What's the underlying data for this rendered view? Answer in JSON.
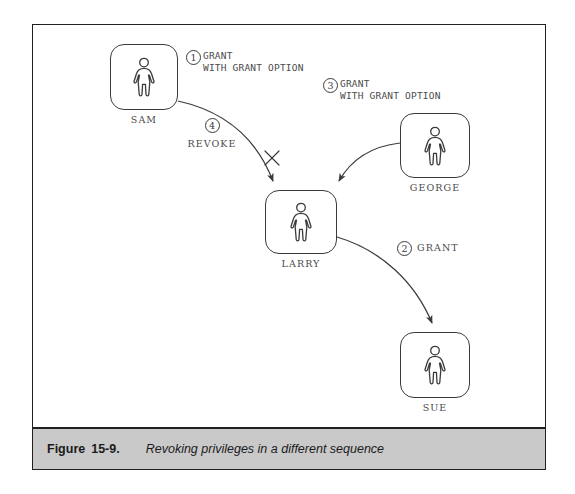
{
  "figure": {
    "caption_label": "Figure",
    "caption_number": "15-9.",
    "caption_title": "Revoking privileges in a different sequence"
  },
  "diagram": {
    "type": "flow-diagram",
    "nodes": [
      {
        "id": "sam",
        "label": "SAM",
        "icon": "person-icon",
        "x": 110,
        "y": 44,
        "w": 68,
        "h": 66
      },
      {
        "id": "george",
        "label": "GEORGE",
        "icon": "person-icon",
        "x": 400,
        "y": 113,
        "w": 70,
        "h": 65
      },
      {
        "id": "larry",
        "label": "LARRY",
        "icon": "person-icon",
        "x": 265,
        "y": 190,
        "w": 72,
        "h": 64
      },
      {
        "id": "sue",
        "label": "SUE",
        "icon": "person-icon",
        "x": 400,
        "y": 332,
        "w": 70,
        "h": 66
      }
    ],
    "edges": [
      {
        "id": "edge-1",
        "step": "1",
        "from": "sam",
        "to": "larry",
        "text_line1": "GRANT",
        "text_line2": "WITH GRANT OPTION",
        "revoked": true
      },
      {
        "id": "edge-2",
        "step": "2",
        "from": "larry",
        "to": "sue",
        "text_line1": "GRANT",
        "text_line2": "",
        "revoked": false
      },
      {
        "id": "edge-3",
        "step": "3",
        "from": "george",
        "to": "larry",
        "text_line1": "GRANT",
        "text_line2": "WITH GRANT OPTION",
        "revoked": false
      },
      {
        "id": "edge-4",
        "step": "4",
        "from": "sam",
        "to": "larry",
        "text_line1": "REVOKE",
        "text_line2": "",
        "revoked": false
      }
    ],
    "marks": [
      {
        "id": "revoke-cross",
        "type": "x-cross",
        "x": 272,
        "y": 158
      }
    ],
    "colors": {
      "frame": "#231f20",
      "node_stroke": "#3b3b3d",
      "arrow": "#3b3b3d",
      "text": "#4a4a4c",
      "caption_band": "#c9c9c9",
      "background": "#ffffff"
    }
  }
}
